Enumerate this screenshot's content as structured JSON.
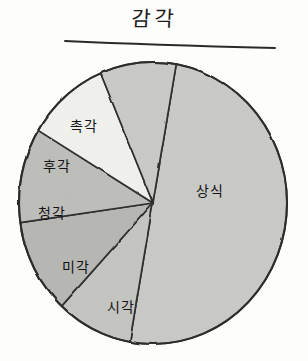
{
  "chart_data": {
    "type": "pie",
    "title": "감각",
    "xlabel": "",
    "ylabel": "",
    "legend_position": "none",
    "grid": false,
    "labels_inside_slices": true,
    "categories": [
      "상식",
      "시각",
      "미각",
      "청각",
      "후각",
      "촉각"
    ],
    "values": [
      50,
      9,
      11,
      11,
      10,
      9
    ],
    "units": "percent",
    "slices": [
      {
        "label": "상식",
        "value": 50,
        "start_angle_deg": -80,
        "end_angle_deg": 100,
        "color": "#c9c9c6",
        "label_x": 196,
        "label_y": 180
      },
      {
        "label": "시각",
        "value": 9,
        "start_angle_deg": 100,
        "end_angle_deg": 133,
        "color": "#c4c4c1",
        "label_x": 107,
        "label_y": 296
      },
      {
        "label": "미각",
        "value": 11,
        "start_angle_deg": 133,
        "end_angle_deg": 172,
        "color": "#b6b6b3",
        "label_x": 62,
        "label_y": 256
      },
      {
        "label": "청각",
        "value": 11,
        "start_angle_deg": 172,
        "end_angle_deg": 211,
        "color": "#bdbdba",
        "label_x": 38,
        "label_y": 202
      },
      {
        "label": "후각",
        "value": 10,
        "start_angle_deg": 211,
        "end_angle_deg": 247,
        "color": "#f1f1ee",
        "label_x": 43,
        "label_y": 155
      },
      {
        "label": "촉각",
        "value": 9,
        "start_angle_deg": 247,
        "end_angle_deg": 280,
        "color": "#c9c9c6",
        "label_x": 70,
        "label_y": 115
      }
    ],
    "colors": {
      "outline": "#2b2b2b",
      "title_rule": "#2b2b2b",
      "background": "#fdfdfc"
    }
  }
}
